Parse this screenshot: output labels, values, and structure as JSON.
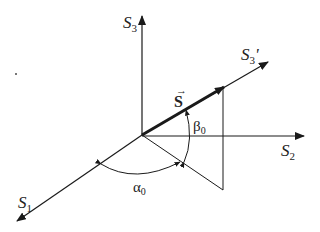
{
  "diagram": {
    "type": "3D coordinate axes with vector and angles",
    "axes": {
      "s1": {
        "base": "S",
        "sub": "1"
      },
      "s2": {
        "base": "S",
        "sub": "2"
      },
      "s3": {
        "base": "S",
        "sub": "3"
      },
      "s3prime": {
        "base": "S",
        "sub": "3",
        "prime": "'"
      }
    },
    "vector": {
      "label": "S",
      "arrow": "→"
    },
    "angles": {
      "alpha": {
        "base": "α",
        "sub": "0"
      },
      "beta": {
        "base": "β",
        "sub": "0"
      }
    },
    "colors": {
      "stroke": "#1a1a1a",
      "background": "#ffffff"
    }
  }
}
